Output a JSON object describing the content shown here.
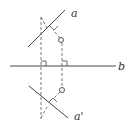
{
  "diagram": {
    "type": "geometry-reflection",
    "labels": {
      "line_a": "a",
      "line_b": "b",
      "line_a_prime": "a'"
    },
    "elements": [
      {
        "id": "line-a",
        "kind": "solid-line",
        "description": "line a, upper diagonal"
      },
      {
        "id": "line-b",
        "kind": "solid-line",
        "description": "horizontal line b (mirror axis)"
      },
      {
        "id": "line-a-prime",
        "kind": "solid-line",
        "description": "line a', reflection of a across b"
      },
      {
        "id": "dashed-perpendicular-left",
        "kind": "dashed-line",
        "description": "perpendicular from a to a' through b"
      },
      {
        "id": "dashed-perpendicular-right",
        "kind": "dashed-line",
        "description": "perpendicular through circle points"
      },
      {
        "id": "point-upper",
        "kind": "open-circle"
      },
      {
        "id": "point-lower",
        "kind": "open-circle"
      },
      {
        "id": "right-angle-markers",
        "kind": "right-angle",
        "count": 4
      }
    ]
  }
}
